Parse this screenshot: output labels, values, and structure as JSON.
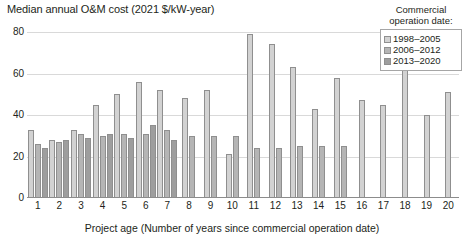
{
  "chart_data": {
    "type": "bar",
    "title": "Median annual O&M cost (2021 $/kW-year)",
    "xlabel": "Project age (Number of years since commercial operation date)",
    "ylabel": "",
    "ylim": [
      0,
      80
    ],
    "yticks": [
      0,
      20,
      40,
      60,
      80
    ],
    "grid": true,
    "legend_position": "top-right",
    "legend_title": "Commercial operation date:",
    "categories": [
      "1",
      "2",
      "3",
      "4",
      "5",
      "6",
      "7",
      "8",
      "9",
      "10",
      "11",
      "12",
      "13",
      "14",
      "15",
      "16",
      "17",
      "18",
      "19",
      "20"
    ],
    "series": [
      {
        "name": "1998–2005",
        "color": "#d2d2d2",
        "values": [
          33,
          28,
          33,
          45,
          50,
          56,
          52,
          48,
          52,
          21,
          79,
          74,
          63,
          43,
          58,
          47,
          45,
          67,
          40,
          51
        ]
      },
      {
        "name": "2006–2012",
        "color": "#b5b5b5",
        "values": [
          26,
          27,
          31,
          30,
          31,
          31,
          33,
          30,
          30,
          30,
          24,
          24,
          25,
          25,
          25,
          null,
          null,
          null,
          null,
          null
        ]
      },
      {
        "name": "2013–2020",
        "color": "#9e9e9e",
        "values": [
          24,
          28,
          29,
          31,
          29,
          35,
          28,
          null,
          null,
          null,
          null,
          null,
          null,
          null,
          null,
          null,
          null,
          null,
          null,
          null
        ]
      }
    ]
  }
}
